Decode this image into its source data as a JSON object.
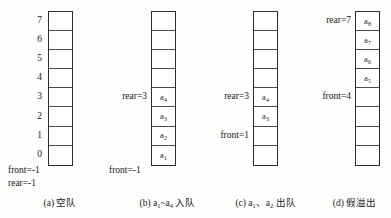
{
  "figure": {
    "indices": [
      "7",
      "6",
      "5",
      "4",
      "3",
      "2",
      "1",
      "0"
    ]
  },
  "panels": [
    {
      "id": "a",
      "caption": "(a) 空队",
      "show_indices": true,
      "cells": [
        "",
        "",
        "",
        "",
        "",
        "",
        "",
        ""
      ],
      "pointers_below": [
        "front=-1",
        "rear=-1"
      ],
      "pointers": []
    },
    {
      "id": "b",
      "caption": "(b) a1~a4 入队",
      "caption_parts": {
        "prefix": "(b) ",
        "a": "a",
        "sub1": "1",
        "tilde": "~",
        "sub2": "4",
        "suffix": " 入队"
      },
      "show_indices": false,
      "cells": [
        "",
        "",
        "",
        "",
        "a4",
        "a3",
        "a2",
        "a1"
      ],
      "cell_subs": [
        "",
        "",
        "",
        "",
        "4",
        "3",
        "2",
        "1"
      ],
      "pointers_below": [
        "front=-1"
      ],
      "pointers": [
        {
          "label": "rear=3",
          "row": 4
        }
      ]
    },
    {
      "id": "c",
      "caption": "(c) a1、a2 出队",
      "caption_parts": {
        "prefix": "(c) ",
        "a": "a",
        "sub1": "1",
        "sep": "、",
        "sub2": "2",
        "suffix": " 出队"
      },
      "show_indices": false,
      "cells": [
        "",
        "",
        "",
        "",
        "a4",
        "a3",
        "",
        ""
      ],
      "cell_subs": [
        "",
        "",
        "",
        "",
        "4",
        "3",
        "",
        ""
      ],
      "pointers_below": [],
      "pointers": [
        {
          "label": "rear=3",
          "row": 4
        },
        {
          "label": "front=1",
          "row": 6
        }
      ]
    },
    {
      "id": "d",
      "caption": "(d) 假溢出",
      "show_indices": false,
      "cells": [
        "a8",
        "a7",
        "a6",
        "a5",
        "",
        "",
        "",
        ""
      ],
      "cell_subs": [
        "8",
        "7",
        "6",
        "5",
        "",
        "",
        "",
        ""
      ],
      "pointers_below": [],
      "pointers": [
        {
          "label": "rear=7",
          "row": 0
        },
        {
          "label": "front=4",
          "row": 4
        }
      ]
    }
  ]
}
